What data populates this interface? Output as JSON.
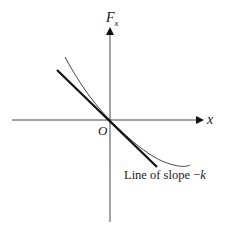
{
  "diagram": {
    "y_axis_label": "F",
    "y_axis_subscript": "x",
    "x_axis_label": "x",
    "origin_label": "O",
    "line_label": "Line of slope −",
    "line_label_var": "k"
  }
}
